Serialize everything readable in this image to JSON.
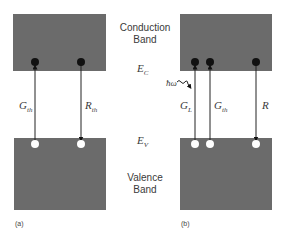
{
  "colors": {
    "band_fill": "#6b6b6b",
    "electron": "#111111",
    "hole": "#ffffff",
    "line": "#222222",
    "text": "#3a3a3a"
  },
  "center_labels": {
    "conduction_line1": "Conduction",
    "conduction_line2": "Band",
    "ec_main": "E",
    "ec_sub": "C",
    "ev_main": "E",
    "ev_sub": "V",
    "valence_line1": "Valence",
    "valence_line2": "Band"
  },
  "panel_a": {
    "caption": "(a)",
    "transitions": [
      {
        "label_main": "G",
        "label_sub": "th",
        "direction": "up"
      },
      {
        "label_main": "R",
        "label_sub": "th",
        "direction": "down"
      }
    ]
  },
  "panel_b": {
    "caption": "(b)",
    "photon_label": "ħω",
    "transitions": [
      {
        "label_main": "G",
        "label_sub": "L",
        "direction": "up"
      },
      {
        "label_main": "G",
        "label_sub": "th",
        "direction": "up"
      },
      {
        "label_main": "R",
        "label_sub": "",
        "direction": "down"
      }
    ]
  }
}
